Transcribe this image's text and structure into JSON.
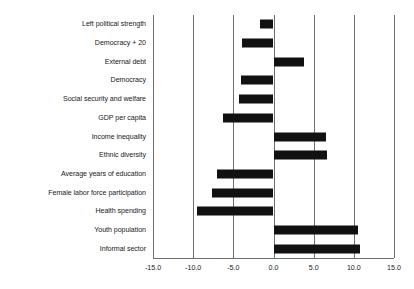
{
  "chart_data": {
    "type": "bar",
    "orientation": "horizontal",
    "title": "",
    "subtitle": "",
    "xlabel": "",
    "ylabel": "",
    "xlim": [
      -15.0,
      15.0
    ],
    "xticks": [
      -15.0,
      -10.0,
      -5.0,
      0.0,
      5.0,
      10.0,
      15.0
    ],
    "xtick_labels": [
      "-15.0",
      "-10.0",
      "-5.0",
      "0.0",
      "5.0",
      "10.0",
      "15.0"
    ],
    "grid": "vertical",
    "legend": "none",
    "bar_color": "#111111",
    "gridline_color": "#6e6e6e",
    "categories": [
      "Left political strength",
      "Democracy + 20",
      "External debt",
      "Democracy",
      "Social security and welfare",
      "GDP per capita",
      "Income inequality",
      "Ethnic diversity",
      "Average years of education",
      "Female labor force participation",
      "Health spending",
      "Youth population",
      "Informal sector"
    ],
    "values": [
      -1.7,
      -3.9,
      3.8,
      -4.0,
      -4.3,
      -6.3,
      6.5,
      6.7,
      -7.0,
      -7.6,
      -9.5,
      10.5,
      10.8
    ]
  }
}
